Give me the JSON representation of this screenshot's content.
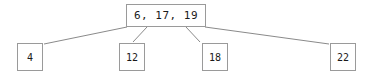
{
  "diagram": {
    "type": "tree",
    "title": "",
    "root": {
      "label": "6, 17, 19",
      "keys": [
        6,
        17,
        19
      ]
    },
    "children": [
      {
        "label": "4",
        "keys": [
          4
        ]
      },
      {
        "label": "12",
        "keys": [
          12
        ]
      },
      {
        "label": "18",
        "keys": [
          18
        ]
      },
      {
        "label": "22",
        "keys": [
          22
        ]
      }
    ],
    "colors": {
      "background": "#ffffff",
      "node_fill": "#ffffff",
      "node_border": "#9a9a9a",
      "edge": "#8a8a8a",
      "text": "#1a1a1a"
    },
    "edges": [
      {
        "from": "root",
        "to": "child-0",
        "x1": 127,
        "y1": 27,
        "x2": 44,
        "y2": 44
      },
      {
        "from": "root",
        "to": "child-1",
        "x1": 147,
        "y1": 27,
        "x2": 133,
        "y2": 42
      },
      {
        "from": "root",
        "to": "child-2",
        "x1": 186,
        "y1": 27,
        "x2": 200,
        "y2": 42
      },
      {
        "from": "root",
        "to": "child-3",
        "x1": 205,
        "y1": 27,
        "x2": 329,
        "y2": 44
      }
    ]
  }
}
